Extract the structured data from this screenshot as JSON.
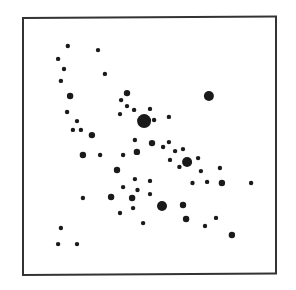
{
  "chart_data": {
    "type": "scatter",
    "title": "",
    "xlabel": "",
    "ylabel": "",
    "xlim": [
      0,
      100
    ],
    "ylim": [
      0,
      100
    ],
    "grid": false,
    "legend": null,
    "axis_ticks": false,
    "frame": true,
    "point_color": "#1a1a1a",
    "size_legend": {
      "s": 2.2,
      "m": 3.2,
      "l": 5.0,
      "xl": 7.0
    },
    "points": [
      {
        "x": 17.9,
        "y": 89.2,
        "size": "s"
      },
      {
        "x": 29.7,
        "y": 87.6,
        "size": "s"
      },
      {
        "x": 14.1,
        "y": 84.2,
        "size": "s"
      },
      {
        "x": 16.4,
        "y": 80.3,
        "size": "s"
      },
      {
        "x": 32.4,
        "y": 78.4,
        "size": "s"
      },
      {
        "x": 15.2,
        "y": 75.7,
        "size": "s"
      },
      {
        "x": 18.8,
        "y": 69.9,
        "size": "m"
      },
      {
        "x": 41.0,
        "y": 71.0,
        "size": "m"
      },
      {
        "x": 38.7,
        "y": 68.3,
        "size": "s"
      },
      {
        "x": 41.0,
        "y": 66.0,
        "size": "s"
      },
      {
        "x": 43.8,
        "y": 64.5,
        "size": "s"
      },
      {
        "x": 38.3,
        "y": 62.9,
        "size": "s"
      },
      {
        "x": 73.0,
        "y": 69.9,
        "size": "l"
      },
      {
        "x": 50.0,
        "y": 64.9,
        "size": "s"
      },
      {
        "x": 47.7,
        "y": 60.2,
        "size": "xl"
      },
      {
        "x": 51.6,
        "y": 60.6,
        "size": "s"
      },
      {
        "x": 57.4,
        "y": 61.8,
        "size": "s"
      },
      {
        "x": 17.6,
        "y": 63.7,
        "size": "s"
      },
      {
        "x": 21.5,
        "y": 60.2,
        "size": "s"
      },
      {
        "x": 19.9,
        "y": 56.8,
        "size": "s"
      },
      {
        "x": 23.0,
        "y": 56.8,
        "size": "s"
      },
      {
        "x": 27.3,
        "y": 54.8,
        "size": "m"
      },
      {
        "x": 44.1,
        "y": 52.9,
        "size": "s"
      },
      {
        "x": 50.8,
        "y": 51.7,
        "size": "m"
      },
      {
        "x": 55.1,
        "y": 50.2,
        "size": "s"
      },
      {
        "x": 57.4,
        "y": 52.1,
        "size": "s"
      },
      {
        "x": 59.8,
        "y": 48.6,
        "size": "s"
      },
      {
        "x": 62.9,
        "y": 49.4,
        "size": "s"
      },
      {
        "x": 57.8,
        "y": 45.2,
        "size": "s"
      },
      {
        "x": 61.5,
        "y": 42.5,
        "size": "s"
      },
      {
        "x": 64.5,
        "y": 44.4,
        "size": "l"
      },
      {
        "x": 68.8,
        "y": 45.9,
        "size": "s"
      },
      {
        "x": 69.9,
        "y": 40.9,
        "size": "s"
      },
      {
        "x": 77.3,
        "y": 42.1,
        "size": "s"
      },
      {
        "x": 23.8,
        "y": 47.1,
        "size": "m"
      },
      {
        "x": 30.5,
        "y": 47.1,
        "size": "s"
      },
      {
        "x": 39.5,
        "y": 47.1,
        "size": "s"
      },
      {
        "x": 44.9,
        "y": 48.3,
        "size": "m"
      },
      {
        "x": 37.1,
        "y": 41.3,
        "size": "m"
      },
      {
        "x": 44.1,
        "y": 37.8,
        "size": "s"
      },
      {
        "x": 50.0,
        "y": 37.1,
        "size": "s"
      },
      {
        "x": 39.5,
        "y": 34.7,
        "size": "s"
      },
      {
        "x": 45.1,
        "y": 33.6,
        "size": "s"
      },
      {
        "x": 66.6,
        "y": 36.3,
        "size": "s"
      },
      {
        "x": 72.3,
        "y": 36.7,
        "size": "s"
      },
      {
        "x": 78.1,
        "y": 36.3,
        "size": "m"
      },
      {
        "x": 89.5,
        "y": 36.3,
        "size": "s"
      },
      {
        "x": 34.8,
        "y": 30.9,
        "size": "m"
      },
      {
        "x": 43.0,
        "y": 30.5,
        "size": "m"
      },
      {
        "x": 50.0,
        "y": 32.0,
        "size": "s"
      },
      {
        "x": 23.8,
        "y": 30.5,
        "size": "s"
      },
      {
        "x": 43.4,
        "y": 26.6,
        "size": "s"
      },
      {
        "x": 38.3,
        "y": 24.7,
        "size": "s"
      },
      {
        "x": 54.7,
        "y": 27.4,
        "size": "l"
      },
      {
        "x": 62.9,
        "y": 27.8,
        "size": "m"
      },
      {
        "x": 64.1,
        "y": 22.4,
        "size": "m"
      },
      {
        "x": 75.8,
        "y": 22.8,
        "size": "s"
      },
      {
        "x": 47.3,
        "y": 20.8,
        "size": "s"
      },
      {
        "x": 71.5,
        "y": 19.7,
        "size": "s"
      },
      {
        "x": 82.0,
        "y": 16.2,
        "size": "m"
      },
      {
        "x": 15.2,
        "y": 18.9,
        "size": "s"
      },
      {
        "x": 14.1,
        "y": 12.7,
        "size": "s"
      },
      {
        "x": 21.5,
        "y": 12.7,
        "size": "s"
      }
    ]
  }
}
